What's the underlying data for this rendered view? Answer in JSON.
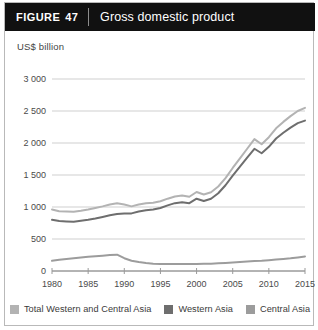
{
  "figure": {
    "tag_word": "FIGURE",
    "tag_number": "47",
    "title": "Gross domestic product"
  },
  "colors": {
    "header_bg": "#111111",
    "card_border": "#b9b9b9",
    "grid": "#cfcfcf",
    "axis": "#9a9a9a",
    "total": "#b3b3b3",
    "western": "#6e6e6e",
    "central": "#9c9c9c",
    "tick_text": "#4a4a4a"
  },
  "legend": {
    "position": "bottom",
    "items": [
      {
        "label": "Total Western and Central Asia",
        "color": "#b3b3b3",
        "swatch": "legend-swatch-total"
      },
      {
        "label": "Western Asia",
        "color": "#6e6e6e",
        "swatch": "legend-swatch-western"
      },
      {
        "label": "Central Asia",
        "color": "#9c9c9c",
        "swatch": "legend-swatch-central"
      }
    ]
  },
  "chart_data": {
    "type": "line",
    "title": "Gross domestic product",
    "subtitle": "",
    "xlabel": "",
    "ylabel": "US$ billion",
    "grid": true,
    "xlim": [
      1980,
      2015
    ],
    "ylim": [
      0,
      3000
    ],
    "ytick_labels": [
      "3 000",
      "2 500",
      "2 000",
      "1 500",
      "1 000",
      "500",
      "0"
    ],
    "yticks": [
      3000,
      2500,
      2000,
      1500,
      1000,
      500,
      0
    ],
    "xticks": [
      1980,
      1985,
      1990,
      1995,
      2000,
      2005,
      2010,
      2015
    ],
    "xtick_labels": [
      "1980",
      "1985",
      "1990",
      "1995",
      "2000",
      "2005",
      "2010",
      "2015"
    ],
    "x": [
      1980,
      1981,
      1982,
      1983,
      1984,
      1985,
      1986,
      1987,
      1988,
      1989,
      1990,
      1991,
      1992,
      1993,
      1994,
      1995,
      1996,
      1997,
      1998,
      1999,
      2000,
      2001,
      2002,
      2003,
      2004,
      2005,
      2006,
      2007,
      2008,
      2009,
      2010,
      2011,
      2012,
      2013,
      2014,
      2015
    ],
    "series": [
      {
        "name": "Total Western and Central Asia",
        "color": "#b3b3b3",
        "values": [
          960,
          935,
          930,
          925,
          940,
          960,
          985,
          1010,
          1040,
          1060,
          1040,
          1010,
          1040,
          1060,
          1065,
          1090,
          1130,
          1165,
          1180,
          1160,
          1235,
          1195,
          1230,
          1320,
          1450,
          1610,
          1760,
          1910,
          2060,
          1980,
          2090,
          2230,
          2330,
          2420,
          2500,
          2550
        ]
      },
      {
        "name": "Western Asia",
        "color": "#6e6e6e",
        "values": [
          800,
          780,
          775,
          770,
          785,
          800,
          820,
          845,
          870,
          890,
          900,
          900,
          930,
          950,
          960,
          985,
          1025,
          1060,
          1075,
          1060,
          1130,
          1095,
          1130,
          1215,
          1340,
          1490,
          1630,
          1770,
          1910,
          1840,
          1940,
          2070,
          2160,
          2240,
          2310,
          2350
        ]
      },
      {
        "name": "Central Asia",
        "color": "#9c9c9c",
        "values": [
          160,
          175,
          188,
          198,
          210,
          222,
          232,
          240,
          250,
          255,
          200,
          160,
          140,
          125,
          115,
          110,
          108,
          108,
          108,
          108,
          110,
          112,
          115,
          120,
          125,
          132,
          140,
          148,
          158,
          160,
          168,
          178,
          188,
          198,
          212,
          228
        ]
      }
    ]
  }
}
